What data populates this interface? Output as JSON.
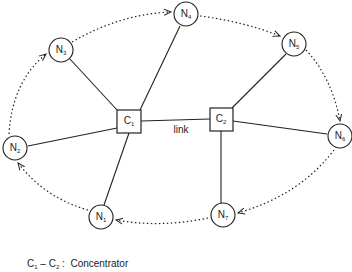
{
  "diagram": {
    "type": "network-topology",
    "colors": {
      "stroke": "#222222",
      "background": "#ffffff"
    },
    "concentrators": [
      {
        "id": "C1",
        "letter": "C",
        "sub": "1",
        "x": 129,
        "y": 121
      },
      {
        "id": "C2",
        "letter": "C",
        "sub": "2",
        "x": 221,
        "y": 119
      }
    ],
    "nodes": [
      {
        "id": "N1",
        "letter": "N",
        "sub": "1",
        "x": 101,
        "y": 217,
        "connects_to": "C1"
      },
      {
        "id": "N2",
        "letter": "N",
        "sub": "2",
        "x": 15,
        "y": 148,
        "connects_to": "C1"
      },
      {
        "id": "N3",
        "letter": "N",
        "sub": "3",
        "x": 61,
        "y": 50,
        "connects_to": "C1"
      },
      {
        "id": "N4",
        "letter": "N",
        "sub": "4",
        "x": 186,
        "y": 14,
        "connects_to": "C1"
      },
      {
        "id": "N5",
        "letter": "N",
        "sub": "5",
        "x": 294,
        "y": 44,
        "connects_to": "C2"
      },
      {
        "id": "N6",
        "letter": "N",
        "sub": "6",
        "x": 340,
        "y": 136,
        "connects_to": "C2"
      },
      {
        "id": "N7",
        "letter": "N",
        "sub": "7",
        "x": 223,
        "y": 215,
        "connects_to": "C2"
      }
    ],
    "link": {
      "from": "C1",
      "to": "C2",
      "label": "link"
    },
    "ring_order": [
      "N3",
      "N4",
      "N5",
      "N6",
      "N7",
      "N1",
      "N2",
      "N3"
    ],
    "ring_style": "dotted-arrows"
  },
  "legend": {
    "c1_letter": "C",
    "c1_sub": "1",
    "dash": " – ",
    "c2_letter": "C",
    "c2_sub": "2",
    "sep": " :  ",
    "text": "Concentrator"
  }
}
